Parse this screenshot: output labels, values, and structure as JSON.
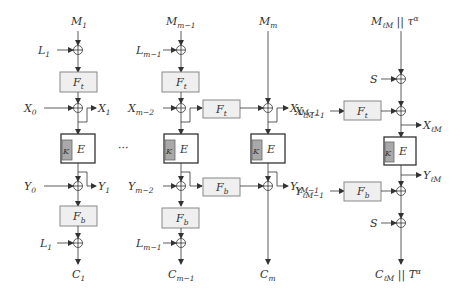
{
  "diagram": {
    "type": "block-cipher mode schematic",
    "columns": [
      {
        "id": "block-1",
        "input": {
          "base": "M",
          "sub": "1"
        },
        "mask_top": {
          "base": "L",
          "sub": "1"
        },
        "f_top": {
          "base": "F",
          "sub": "t"
        },
        "x_in": {
          "base": "X",
          "sub": "0"
        },
        "x_out": {
          "base": "X",
          "sub": "1"
        },
        "cipher": {
          "key": "K",
          "label": "E"
        },
        "y_in": {
          "base": "Y",
          "sub": "0"
        },
        "y_out": {
          "base": "Y",
          "sub": "1"
        },
        "f_bottom": {
          "base": "F",
          "sub": "b"
        },
        "mask_bottom": {
          "base": "L",
          "sub": "1"
        },
        "output": {
          "base": "C",
          "sub": "1"
        }
      },
      {
        "id": "block-m-1",
        "input": {
          "base": "M",
          "sub": "m−1"
        },
        "mask_top": {
          "base": "L",
          "sub": "m−1"
        },
        "f_top": {
          "base": "F",
          "sub": "t"
        },
        "x_in": {
          "base": "X",
          "sub": "m−2"
        },
        "cipher": {
          "key": "K",
          "label": "E"
        },
        "y_in": {
          "base": "Y",
          "sub": "m−2"
        },
        "f_bottom": {
          "base": "F",
          "sub": "b"
        },
        "mask_bottom": {
          "base": "L",
          "sub": "m−1"
        },
        "output": {
          "base": "C",
          "sub": "m−1"
        }
      },
      {
        "id": "block-m",
        "input": {
          "base": "M",
          "sub": "m"
        },
        "f_link_top": {
          "base": "F",
          "sub": "t"
        },
        "x_out": {
          "base": "X",
          "sub": "ℓM−1"
        },
        "cipher": {
          "key": "K",
          "label": "E"
        },
        "f_link_bottom": {
          "base": "F",
          "sub": "b"
        },
        "y_out": {
          "base": "Y",
          "sub": "ℓM−1"
        },
        "output": {
          "base": "C",
          "sub": "m"
        }
      },
      {
        "id": "block-final",
        "input": {
          "base": "M",
          "sub": "ℓM",
          "suffix": " || τ",
          "sup": "α"
        },
        "mask_top": {
          "base": "S"
        },
        "f_top": {
          "base": "F",
          "sub": "t"
        },
        "x_out": {
          "base": "X",
          "sub": "ℓM"
        },
        "cipher": {
          "key": "K",
          "label": "E"
        },
        "y_out": {
          "base": "Y",
          "sub": "ℓM"
        },
        "f_bottom": {
          "base": "F",
          "sub": "b"
        },
        "mask_bottom": {
          "base": "S"
        },
        "output": {
          "base": "C",
          "sub": "ℓM",
          "suffix": " || T",
          "sup": "α"
        }
      }
    ],
    "ellipsis": "···"
  }
}
